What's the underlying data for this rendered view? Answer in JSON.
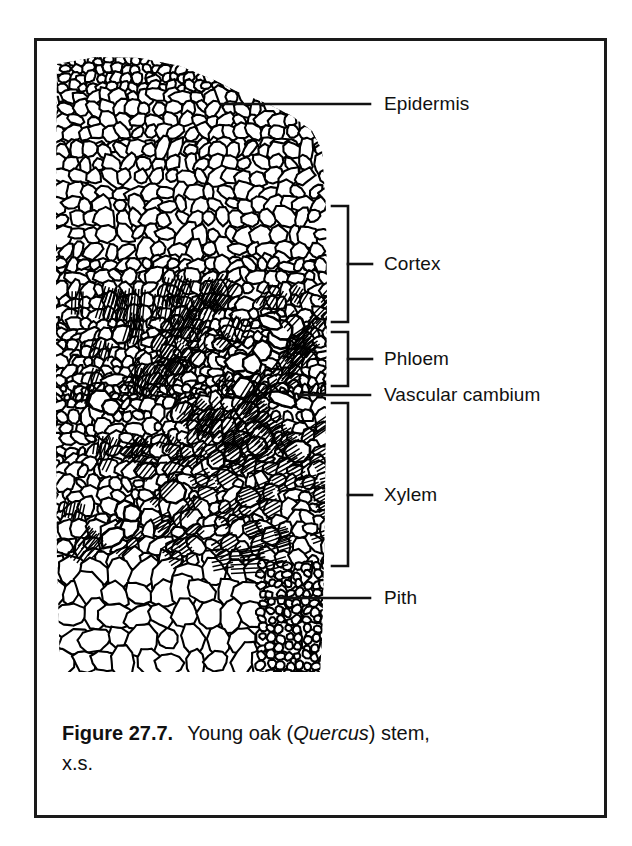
{
  "figure": {
    "frame_color": "#1a1a1a",
    "background": "#ffffff",
    "ink_color": "#000000"
  },
  "caption": {
    "figure_number": "Figure 27.7.",
    "text_before_genus": "Young oak (",
    "genus": "Quercus",
    "text_after_genus": ") stem,",
    "second_line": "x.s."
  },
  "labels": [
    {
      "id": "epidermis",
      "text": "Epidermis",
      "type": "leader"
    },
    {
      "id": "cortex",
      "text": "Cortex",
      "type": "bracket"
    },
    {
      "id": "phloem",
      "text": "Phloem",
      "type": "bracket"
    },
    {
      "id": "vascular-cambium",
      "text": "Vascular cambium",
      "type": "leader"
    },
    {
      "id": "xylem",
      "text": "Xylem",
      "type": "bracket"
    },
    {
      "id": "pith",
      "text": "Pith",
      "type": "leader"
    }
  ],
  "diagram": {
    "zones": [
      {
        "name": "Epidermis",
        "description": "outermost single layer of small cells"
      },
      {
        "name": "Cortex",
        "description": "broad band of rounded parenchyma cells"
      },
      {
        "name": "Phloem",
        "description": "band of small cells outside the cambium"
      },
      {
        "name": "Vascular cambium",
        "description": "thin dividing layer between phloem and xylem"
      },
      {
        "name": "Xylem",
        "description": "radial files of vessels and fibers"
      },
      {
        "name": "Pith",
        "description": "central region of large parenchyma cells"
      }
    ]
  }
}
